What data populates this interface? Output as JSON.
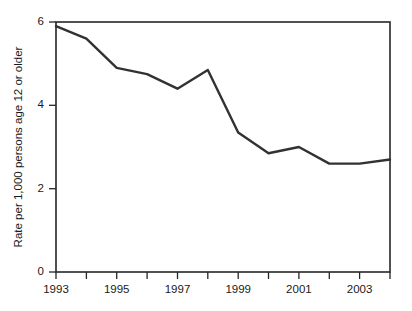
{
  "chart_data": {
    "type": "line",
    "title": "",
    "subtitle": "",
    "xlabel": "",
    "ylabel": "Rate per 1,000 persons age 12 or older",
    "x": [
      1993,
      1994,
      1995,
      1996,
      1997,
      1998,
      1999,
      2000,
      2001,
      2002,
      2003,
      2004
    ],
    "values": [
      5.9,
      5.6,
      4.9,
      4.75,
      4.4,
      4.85,
      3.35,
      2.85,
      3.0,
      2.6,
      2.6,
      2.7
    ],
    "series": [
      {
        "name": "Rate per 1,000 persons age 12 or older",
        "values": [
          5.9,
          5.6,
          4.9,
          4.75,
          4.4,
          4.85,
          3.35,
          2.85,
          3.0,
          2.6,
          2.6,
          2.7
        ],
        "color": "#33322f"
      }
    ],
    "xlim": [
      1993,
      2004
    ],
    "ylim": [
      0,
      6
    ],
    "y_ticks": [
      0,
      2,
      4,
      6
    ],
    "y_tick_labels": [
      "0",
      "2",
      "4",
      "6"
    ],
    "x_ticks": [
      1993,
      1994,
      1995,
      1996,
      1997,
      1998,
      1999,
      2000,
      2001,
      2002,
      2003,
      2004
    ],
    "x_tick_labels": [
      "1993",
      "",
      "1995",
      "",
      "1997",
      "",
      "1999",
      "",
      "2001",
      "",
      "2003",
      ""
    ],
    "x_labeled_ticks": [
      {
        "value": 1993,
        "label": "1993"
      },
      {
        "value": 1995,
        "label": "1995"
      },
      {
        "value": 1997,
        "label": "1997"
      },
      {
        "value": 1999,
        "label": "1999"
      },
      {
        "value": 2001,
        "label": "2001"
      },
      {
        "value": 2003,
        "label": "2003"
      }
    ],
    "grid": false,
    "legend": false,
    "legend_position": "none",
    "annotations": [],
    "frame": "full-box"
  },
  "labels": {
    "y_axis_title": "Rate per 1,000 persons age 12 or older",
    "y_tick_0": "0",
    "y_tick_2": "2",
    "y_tick_4": "4",
    "y_tick_6": "6",
    "x_tick_1993": "1993",
    "x_tick_1995": "1995",
    "x_tick_1997": "1997",
    "x_tick_1999": "1999",
    "x_tick_2001": "2001",
    "x_tick_2003": "2003"
  },
  "colors": {
    "line": "#33322f",
    "axis": "#262626",
    "text": "#1a1a1a",
    "background": "#ffffff"
  }
}
